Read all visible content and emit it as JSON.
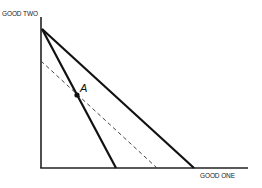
{
  "diagram": {
    "type": "budget-constraint",
    "axes": {
      "y_label": "GOOD TWO",
      "x_label": "GOOD ONE",
      "origin": [
        41,
        168
      ],
      "y_top": [
        41,
        17
      ],
      "x_end": [
        248,
        168
      ]
    },
    "lines": [
      {
        "name": "steep-budget-line",
        "style": "solid",
        "from": [
          42,
          29
        ],
        "to": [
          116,
          168
        ]
      },
      {
        "name": "outer-budget-line",
        "style": "solid",
        "from": [
          42,
          29
        ],
        "to": [
          194,
          168
        ]
      },
      {
        "name": "dashed-compensated-line",
        "style": "dashed",
        "from": [
          41,
          61
        ],
        "to": [
          157,
          168
        ]
      }
    ],
    "points": [
      {
        "label": "A",
        "position": [
          77,
          95
        ]
      }
    ],
    "colors": {
      "line": "#111111",
      "axis": "#222222",
      "dashed": "#444444",
      "background": "#ffffff"
    }
  }
}
